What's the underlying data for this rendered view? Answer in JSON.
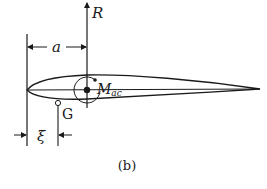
{
  "figure": {
    "caption": "(b)",
    "labels": {
      "resultant_force": "R",
      "distance_a": "a",
      "moment_main": "M",
      "moment_sub": "ac",
      "center_of_gravity": "G",
      "distance_xi": "ξ"
    },
    "colors": {
      "ink": "#1a1a1a",
      "background": "#ffffff"
    }
  }
}
